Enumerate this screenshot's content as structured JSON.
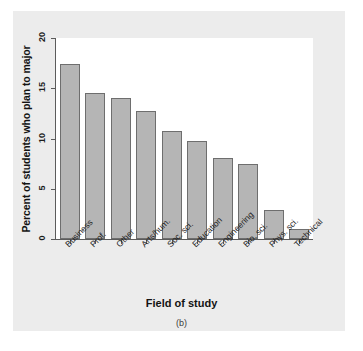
{
  "chart_data": {
    "type": "bar",
    "title": "",
    "subtitle": "",
    "caption": "(b)",
    "xlabel": "Field of study",
    "ylabel": "Percent of students who plan to major",
    "categories": [
      "Business",
      "Prof.",
      "Other",
      "Arts/hum.",
      "Soc. sci.",
      "Education",
      "Engineering",
      "Bio. sci.",
      "Phys. sci.",
      "Technical"
    ],
    "values": [
      17.4,
      14.5,
      14.0,
      12.7,
      10.7,
      9.8,
      8.1,
      7.5,
      2.9,
      1.0
    ],
    "ylim": [
      0,
      20
    ],
    "yticks": [
      0,
      5,
      10,
      15,
      20
    ],
    "ytick_labels": [
      "0",
      "5",
      "10",
      "15",
      "20"
    ],
    "grid": false,
    "legend": null,
    "bar_color": "#b5b5b5",
    "bar_edge_color": "#6e6e6e",
    "axis_color": "#5b5b5b",
    "plot_background": "#ffffff",
    "figure_background": "#ececec"
  }
}
